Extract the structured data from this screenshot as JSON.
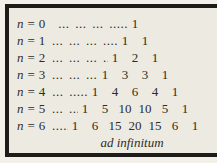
{
  "figure": {
    "caption": "ad infinitum",
    "rows": [
      {
        "var": "n",
        "eq": "=",
        "index": "0",
        "dots": "... ... ... .....",
        "values": [
          1
        ]
      },
      {
        "var": "n",
        "eq": "=",
        "index": "1",
        "dots": "... ... ... ....",
        "values": [
          1,
          1
        ]
      },
      {
        "var": "n",
        "eq": "=",
        "index": "2",
        "dots": "... ... ... ...",
        "values": [
          1,
          2,
          1
        ]
      },
      {
        "var": "n",
        "eq": "=",
        "index": "3",
        "dots": "... ... ....",
        "values": [
          1,
          3,
          3,
          1
        ]
      },
      {
        "var": "n",
        "eq": "=",
        "index": "4",
        "dots": "... .....",
        "values": [
          1,
          4,
          6,
          4,
          1
        ]
      },
      {
        "var": "n",
        "eq": "=",
        "index": "5",
        "dots": "... ...",
        "values": [
          1,
          5,
          10,
          10,
          5,
          1
        ]
      },
      {
        "var": "n",
        "eq": "=",
        "index": "6",
        "dots": ".....",
        "values": [
          1,
          6,
          15,
          20,
          15,
          6,
          1
        ]
      }
    ],
    "colors": {
      "paper": "#edebe1",
      "margin": "#f2f0e9",
      "border": "#1e1c19",
      "ink": "#2e2c29"
    }
  }
}
